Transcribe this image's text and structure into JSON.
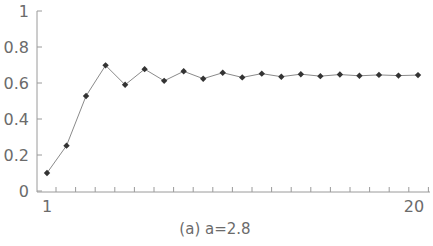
{
  "chart_data": {
    "type": "line",
    "title": "",
    "caption": "(a) a=2.8",
    "xlabel": "",
    "ylabel": "",
    "x": [
      1,
      2,
      3,
      4,
      5,
      6,
      7,
      8,
      9,
      10,
      11,
      12,
      13,
      14,
      15,
      16,
      17,
      18,
      19,
      20
    ],
    "series": [
      {
        "name": "a=2.8",
        "values": [
          0.1,
          0.252,
          0.528,
          0.698,
          0.59,
          0.677,
          0.612,
          0.665,
          0.624,
          0.657,
          0.631,
          0.652,
          0.635,
          0.649,
          0.638,
          0.647,
          0.64,
          0.645,
          0.641,
          0.644
        ],
        "marker": "diamond",
        "color": "#333333"
      }
    ],
    "xlim": [
      1,
      20
    ],
    "ylim": [
      0,
      1
    ],
    "x_tick_labels": [
      "1",
      "20"
    ],
    "y_tick_labels": [
      "0",
      "0.2",
      "0.4",
      "0.6",
      "0.8",
      "1"
    ],
    "grid": false,
    "legend": "none"
  },
  "colors": {
    "axis": "#9a9a9a",
    "line": "#8a8a8a",
    "marker": "#333333",
    "text": "#6b6b6b"
  }
}
